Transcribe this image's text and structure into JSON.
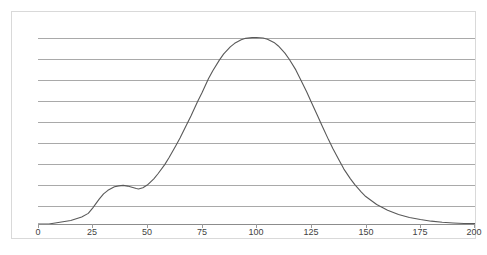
{
  "chart_data": {
    "type": "line",
    "title": "",
    "subtitle": "",
    "xlabel": "",
    "ylabel": "",
    "xlim": [
      0,
      200
    ],
    "ylim": [
      0,
      0.0105
    ],
    "grid": true,
    "gridline_count": 9,
    "legend": null,
    "xticks": [
      0,
      25,
      50,
      75,
      100,
      125,
      150,
      175,
      200
    ],
    "xticklabels": [
      "0",
      "25",
      "50",
      "75",
      "100",
      "125",
      "150",
      "175",
      "200"
    ],
    "yticklabels": [],
    "series": [
      {
        "name": "distribution",
        "color": "#595959",
        "x": [
          0,
          5,
          10,
          15,
          20,
          23,
          25,
          28,
          30,
          32,
          35,
          37,
          39,
          41,
          43,
          45,
          46,
          48,
          50,
          53,
          55,
          58,
          60,
          63,
          65,
          68,
          70,
          73,
          75,
          78,
          80,
          83,
          85,
          88,
          90,
          93,
          95,
          98,
          100,
          103,
          105,
          108,
          110,
          113,
          115,
          118,
          120,
          123,
          125,
          128,
          130,
          133,
          135,
          138,
          140,
          143,
          145,
          148,
          150,
          155,
          160,
          165,
          170,
          175,
          180,
          185,
          190,
          195,
          200
        ],
        "y": [
          0.0,
          0.0,
          0.0001,
          0.0002,
          0.0004,
          0.0006,
          0.0009,
          0.0014,
          0.0017,
          0.0019,
          0.0021,
          0.00215,
          0.00218,
          0.00214,
          0.00207,
          0.002,
          0.00198,
          0.00205,
          0.0022,
          0.00255,
          0.00285,
          0.00335,
          0.00375,
          0.0044,
          0.00485,
          0.0056,
          0.0061,
          0.0069,
          0.0074,
          0.0082,
          0.00865,
          0.00925,
          0.0096,
          0.01,
          0.0102,
          0.0104,
          0.01048,
          0.01052,
          0.01053,
          0.0105,
          0.01043,
          0.01025,
          0.01005,
          0.00965,
          0.0093,
          0.0087,
          0.0082,
          0.00745,
          0.0069,
          0.0061,
          0.00555,
          0.00475,
          0.00425,
          0.00355,
          0.0031,
          0.00255,
          0.00222,
          0.0018,
          0.00155,
          0.0011,
          0.00078,
          0.00054,
          0.00037,
          0.00025,
          0.00016,
          0.0001,
          6e-05,
          3e-05,
          2e-05
        ]
      }
    ],
    "annotations": [
      {
        "label": "shoulder-bump",
        "x": 39,
        "y": 0.00218
      },
      {
        "label": "main-peak",
        "x": 100,
        "y": 0.01053
      }
    ]
  },
  "colors": {
    "frame_border": "#d9d9d9",
    "gridline": "#a9a9a9",
    "axis_line": "#8c8c8c",
    "curve": "#595959",
    "tick_label": "#3f3f3f",
    "background": "#ffffff"
  }
}
